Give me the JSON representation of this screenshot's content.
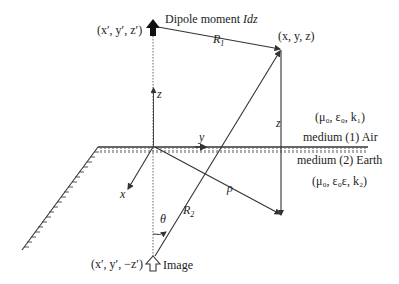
{
  "diagram": {
    "labels": {
      "source_coords": "(x′, y′, z′)",
      "dipole_label": "Dipole moment ",
      "dipole_label_italic": "Idz",
      "r1": "R",
      "r1_sub": "1",
      "field_point": "(x, y, z)",
      "z_axis": "z",
      "z_height": "z",
      "y_axis": "y",
      "x_axis": "x",
      "rho": "ρ",
      "theta": "θ",
      "r2": "R",
      "r2_sub": "2",
      "medium1_params": "(μ₀, ε₀, k₁)",
      "medium1_name": "medium (1) Air",
      "medium2_name": "medium (2) Earth",
      "medium2_params": "(μ₀, ε₀ε, k₂)",
      "image_coords": "(x′, y′, −z′)",
      "image_label": "Image"
    },
    "colors": {
      "line": "#333333",
      "text": "#222222",
      "dotted": "#555555"
    }
  }
}
